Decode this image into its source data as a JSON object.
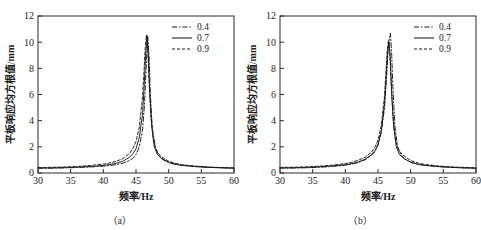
{
  "figure": {
    "background_color": "#ffffff",
    "line_color": "#1a1a1a",
    "axis_color": "#2b2b2b"
  },
  "panels": [
    {
      "id": "panel-a",
      "subcaption": "（a）",
      "chart_data": {
        "type": "line",
        "title": "",
        "xlabel": "频率/Hz",
        "ylabel": "平板响应均方根值/mm",
        "xlim": [
          30,
          60
        ],
        "ylim": [
          0,
          12
        ],
        "xticks": [
          30,
          35,
          40,
          45,
          50,
          55,
          60
        ],
        "yticks": [
          0,
          2,
          4,
          6,
          8,
          10,
          12
        ],
        "grid": false,
        "legend_position": "top-right",
        "series": [
          {
            "name": "0.4",
            "style": "dash-dot",
            "x": [
              30,
              32,
              34,
              36,
              38,
              40,
              41,
              42,
              43,
              44,
              44.5,
              45,
              45.5,
              46,
              46.3,
              46.6,
              46.8,
              47.0,
              47.2,
              47.5,
              48,
              48.5,
              49,
              50,
              51,
              52,
              54,
              56,
              58,
              60
            ],
            "y": [
              0.36,
              0.37,
              0.39,
              0.42,
              0.46,
              0.52,
              0.57,
              0.64,
              0.75,
              0.95,
              1.12,
              1.42,
              2.0,
              3.3,
              5.2,
              8.6,
              10.4,
              8.9,
              6.0,
              3.4,
              1.9,
              1.35,
              1.1,
              0.82,
              0.68,
              0.6,
              0.5,
              0.44,
              0.4,
              0.37
            ]
          },
          {
            "name": "0.7",
            "style": "solid",
            "x": [
              30,
              32,
              34,
              36,
              38,
              40,
              41,
              42,
              43,
              44,
              44.5,
              45,
              45.5,
              46,
              46.2,
              46.5,
              46.7,
              46.9,
              47.1,
              47.4,
              47.8,
              48.3,
              49,
              50,
              51,
              52,
              54,
              56,
              58,
              60
            ],
            "y": [
              0.38,
              0.39,
              0.41,
              0.45,
              0.5,
              0.58,
              0.65,
              0.75,
              0.9,
              1.2,
              1.45,
              1.85,
              2.7,
              4.5,
              6.2,
              9.2,
              10.5,
              9.0,
              6.2,
              3.6,
              2.0,
              1.4,
              1.05,
              0.8,
              0.66,
              0.58,
              0.49,
              0.43,
              0.4,
              0.37
            ]
          },
          {
            "name": "0.9",
            "style": "dashed",
            "x": [
              30,
              32,
              34,
              36,
              38,
              40,
              41,
              42,
              43,
              44,
              44.5,
              45,
              45.5,
              46,
              46.2,
              46.4,
              46.6,
              46.8,
              47.0,
              47.3,
              47.7,
              48.2,
              49,
              50,
              51,
              52,
              54,
              56,
              58,
              60
            ],
            "y": [
              0.42,
              0.43,
              0.46,
              0.5,
              0.57,
              0.68,
              0.77,
              0.9,
              1.1,
              1.5,
              1.85,
              2.4,
              3.5,
              5.8,
              7.5,
              9.5,
              10.55,
              9.5,
              7.0,
              4.2,
              2.4,
              1.6,
              1.2,
              0.9,
              0.74,
              0.64,
              0.53,
              0.46,
              0.42,
              0.39
            ]
          }
        ]
      },
      "legend": [
        {
          "label": "0.4",
          "style": "dash-dot"
        },
        {
          "label": "0.7",
          "style": "solid"
        },
        {
          "label": "0.9",
          "style": "dashed"
        }
      ]
    },
    {
      "id": "panel-b",
      "subcaption": "（b）",
      "chart_data": {
        "type": "line",
        "title": "",
        "xlabel": "频率/Hz",
        "ylabel": "平板响应均方根值/mm",
        "xlim": [
          30,
          60
        ],
        "ylim": [
          0,
          12
        ],
        "xticks": [
          30,
          35,
          40,
          45,
          50,
          55,
          60
        ],
        "yticks": [
          0,
          2,
          4,
          6,
          8,
          10,
          12
        ],
        "grid": false,
        "legend_position": "top-right",
        "series": [
          {
            "name": "0.4",
            "style": "dash-dot",
            "x": [
              30,
              32,
              34,
              36,
              38,
              40,
              41,
              42,
              43,
              44,
              44.5,
              45,
              45.5,
              46,
              46.3,
              46.6,
              46.9,
              47.1,
              47.3,
              47.6,
              48,
              48.5,
              49,
              50,
              51,
              52,
              54,
              56,
              58,
              60
            ],
            "y": [
              0.37,
              0.38,
              0.4,
              0.44,
              0.5,
              0.6,
              0.68,
              0.8,
              1.0,
              1.35,
              1.6,
              2.1,
              3.1,
              5.0,
              7.2,
              9.9,
              10.7,
              9.0,
              6.3,
              3.5,
              2.0,
              1.4,
              1.1,
              0.82,
              0.67,
              0.59,
              0.49,
              0.43,
              0.39,
              0.36
            ]
          },
          {
            "name": "0.7",
            "style": "solid",
            "x": [
              30,
              32,
              34,
              36,
              38,
              40,
              41,
              42,
              43,
              44,
              44.5,
              45,
              45.5,
              46,
              46.2,
              46.5,
              46.7,
              46.9,
              47.1,
              47.4,
              47.8,
              48.3,
              49,
              50,
              51,
              52,
              54,
              56,
              58,
              60
            ],
            "y": [
              0.39,
              0.4,
              0.43,
              0.47,
              0.54,
              0.64,
              0.72,
              0.85,
              1.05,
              1.4,
              1.7,
              2.2,
              3.2,
              5.3,
              7.0,
              9.4,
              10.0,
              8.6,
              6.0,
              3.5,
              2.0,
              1.4,
              1.1,
              0.83,
              0.68,
              0.6,
              0.5,
              0.44,
              0.4,
              0.37
            ]
          },
          {
            "name": "0.9",
            "style": "dashed",
            "x": [
              30,
              32,
              34,
              36,
              38,
              40,
              41,
              42,
              43,
              44,
              44.5,
              45,
              45.5,
              46,
              46.2,
              46.4,
              46.6,
              46.8,
              47.0,
              47.3,
              47.7,
              48.2,
              49,
              50,
              51,
              52,
              54,
              56,
              58,
              60
            ],
            "y": [
              0.43,
              0.44,
              0.47,
              0.52,
              0.6,
              0.72,
              0.82,
              0.98,
              1.2,
              1.6,
              1.95,
              2.5,
              3.6,
              5.9,
              7.6,
              9.3,
              10.1,
              9.2,
              7.0,
              4.3,
              2.5,
              1.7,
              1.3,
              0.95,
              0.78,
              0.67,
              0.55,
              0.47,
              0.43,
              0.4
            ]
          }
        ]
      },
      "legend": [
        {
          "label": "0.4",
          "style": "dash-dot"
        },
        {
          "label": "0.7",
          "style": "solid"
        },
        {
          "label": "0.9",
          "style": "dashed"
        }
      ]
    }
  ]
}
